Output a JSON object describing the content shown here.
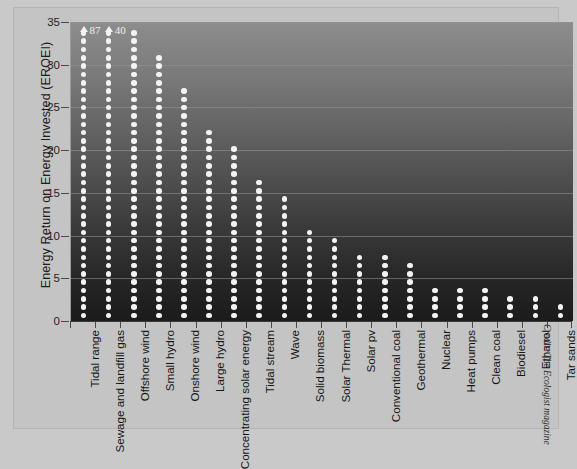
{
  "chart_data": {
    "type": "bar",
    "title": "",
    "subtitle": "",
    "xlabel": "",
    "ylabel": "Energy Return on Energy Invested (EROEI)",
    "ylim": [
      0,
      35
    ],
    "yticks": [
      0,
      5,
      10,
      15,
      20,
      25,
      30,
      35
    ],
    "grid": true,
    "legend": null,
    "style": "dot-column chart (stacked circles), dark gradient plot background, white dots",
    "categories": [
      "Tidal range",
      "Sewage and landfill gas",
      "Offshore wind",
      "Small hydro",
      "Onshore wind",
      "Large hydro",
      "Concentrating solar energy",
      "Tidal stream",
      "Wave",
      "Solid biomass",
      "Solar Thermal",
      "Solar pv",
      "Conventional coal",
      "Geothermal",
      "Nuclear",
      "Heat pumps",
      "Clean coal",
      "Biodiesel",
      "Ethanol",
      "Tar sands"
    ],
    "values": [
      35,
      35,
      35,
      32,
      28,
      23,
      21,
      17,
      15,
      11,
      10,
      8,
      8,
      7,
      4,
      4,
      4,
      3,
      3,
      2
    ],
    "clipped": [
      true,
      true,
      false,
      false,
      false,
      false,
      false,
      false,
      false,
      false,
      false,
      false,
      false,
      false,
      false,
      false,
      false,
      false,
      false,
      false
    ],
    "annotations": [
      {
        "category": "Tidal range",
        "label": "87",
        "marker": "up-arrow"
      },
      {
        "category": "Sewage and landfill gas",
        "label": "40",
        "marker": "up-arrow"
      }
    ]
  },
  "credit": "Credit: The Ecologist magazine",
  "colors": {
    "dot": "#f3f3f3",
    "page_bg": "#c9c9c9",
    "frame_bg": "#c4c4c4",
    "plot_top": "#8d8d8d",
    "plot_bottom": "#1b1b1b",
    "axis": "#3a3a3a",
    "text": "#161616"
  }
}
